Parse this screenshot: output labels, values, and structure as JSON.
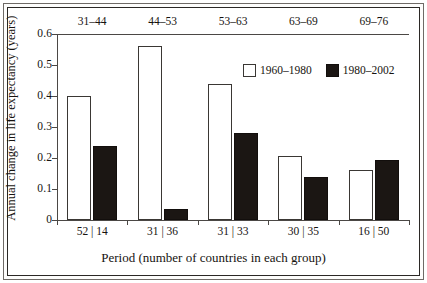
{
  "chart_data": {
    "type": "bar",
    "title": "",
    "xlabel": "Period (number of countries in each group)",
    "ylabel": "Annual change in life expectancy (years)",
    "ylim": [
      0,
      0.6
    ],
    "ytick_labels": [
      "0",
      "0.1",
      "0.2",
      "0.3",
      "0.4",
      "0.5",
      "0.6"
    ],
    "ytick_values": [
      0,
      0.1,
      0.2,
      0.3,
      0.4,
      0.5,
      0.6
    ],
    "grid": false,
    "legend_position": "inside-top-right",
    "categories": [
      "52 | 14",
      "31 | 36",
      "31 | 33",
      "30 | 35",
      "16 | 50"
    ],
    "group_headers": [
      "31–44",
      "44–53",
      "53–63",
      "63–69",
      "69–76"
    ],
    "series": [
      {
        "name": "1960–1980",
        "color": "#ffffff",
        "edge_color": "#3a3734",
        "values": [
          0.4,
          0.56,
          0.44,
          0.205,
          0.16
        ]
      },
      {
        "name": "1980–2002",
        "color": "#1b1613",
        "edge_color": "#120e0c",
        "values": [
          0.238,
          0.037,
          0.28,
          0.14,
          0.192
        ]
      }
    ]
  },
  "legend": {
    "entries": [
      {
        "label": "1960–1980",
        "swatch": "light"
      },
      {
        "label": "1980–2002",
        "swatch": "dark"
      }
    ]
  },
  "axes": {
    "y_title": "Annual change in life expectancy (years)",
    "x_title": "Period (number of countries in each group)"
  }
}
